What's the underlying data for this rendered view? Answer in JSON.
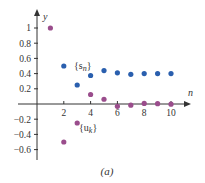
{
  "chart_data": {
    "type": "scatter",
    "title": "",
    "caption": "(a)",
    "xlabel": "n",
    "ylabel": "y",
    "xlim": [
      0,
      11.5
    ],
    "ylim": [
      -0.65,
      1.15
    ],
    "grid": false,
    "x_ticks": [
      2,
      4,
      6,
      8,
      10
    ],
    "x_tick_labels": [
      "2",
      "4",
      "6",
      "8",
      "10"
    ],
    "y_ticks": [
      1,
      0.8,
      0.6,
      0.4,
      0.2,
      -0.2,
      -0.4,
      -0.6
    ],
    "y_tick_labels": [
      "1",
      "0.8",
      "0.6",
      "0.4",
      "0.2",
      "−0.2",
      "−0.4",
      "−0.6"
    ],
    "series": [
      {
        "name": "{s_n}",
        "label_main": "{s",
        "label_sub": "n",
        "color": "#2a5fae",
        "x": [
          2,
          3,
          4,
          5,
          6,
          7,
          8,
          9,
          10
        ],
        "values": [
          0.5,
          0.25,
          0.375,
          0.44,
          0.41,
          0.39,
          0.4,
          0.4,
          0.4
        ]
      },
      {
        "name": "{u_k}",
        "label_main": "{u",
        "label_sub": "k",
        "color": "#9a4d8c",
        "x": [
          1,
          2,
          3,
          4,
          5,
          6,
          7,
          8,
          9,
          10
        ],
        "values": [
          1.0,
          -0.5,
          -0.25,
          0.125,
          0.0625,
          -0.03,
          -0.015,
          0.008,
          0.004,
          -0.002
        ]
      }
    ]
  }
}
